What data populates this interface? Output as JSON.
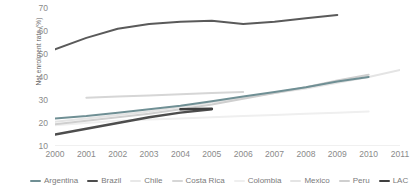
{
  "chart_data": {
    "type": "line",
    "title": "",
    "xlabel": "",
    "ylabel": "Net enrolment rate (%)",
    "xlim": [
      2000,
      2011
    ],
    "ylim": [
      10,
      70
    ],
    "yticks": [
      70,
      60,
      50,
      40,
      30,
      20,
      10
    ],
    "xticks": [
      2000,
      2001,
      2002,
      2003,
      2004,
      2005,
      2006,
      2007,
      2008,
      2009,
      2010,
      2011
    ],
    "grid": false,
    "legend_position": "bottom",
    "series": [
      {
        "name": "Argentina",
        "color": "#6f8f94",
        "width": 2.0,
        "x": [
          2000,
          2001,
          2002,
          2003,
          2004,
          2005,
          2006,
          2007,
          2008,
          2009,
          2010
        ],
        "values": [
          22,
          23,
          24.5,
          26,
          27.5,
          29.5,
          31.5,
          33.5,
          35.5,
          38,
          40
        ]
      },
      {
        "name": "Brazil",
        "color": "#4d4d4d",
        "width": 2.4,
        "x": [
          2000,
          2001,
          2002,
          2003,
          2004,
          2005
        ],
        "values": [
          15,
          17.5,
          20,
          22.5,
          24.5,
          26
        ]
      },
      {
        "name": "Chile",
        "color": "#5a5a5a",
        "width": 2.0,
        "x": [
          2000,
          2001,
          2002,
          2003,
          2004,
          2005,
          2006,
          2007,
          2008,
          2009
        ],
        "values": [
          52,
          57,
          61,
          63,
          64,
          64.5,
          63,
          64,
          65.5,
          67
        ]
      },
      {
        "name": "Costa Rica",
        "color": "#d6d6d6",
        "width": 2.0,
        "x": [
          2001,
          2002,
          2003,
          2004,
          2005,
          2006
        ],
        "values": [
          31,
          31.5,
          32,
          32.5,
          33,
          33.5
        ]
      },
      {
        "name": "Colombia",
        "color": "#efefef",
        "width": 2.0,
        "x": [
          2000,
          2001,
          2002,
          2003,
          2004,
          2005,
          2006,
          2007,
          2008,
          2009,
          2010
        ],
        "values": [
          19,
          20,
          21,
          21.5,
          22,
          22.5,
          23,
          23.5,
          24,
          24.5,
          25
        ]
      },
      {
        "name": "Mexico",
        "color": "#e4e4e4",
        "width": 2.0,
        "x": [
          2000,
          2001,
          2002,
          2003,
          2004,
          2005,
          2006,
          2007,
          2008,
          2009,
          2010,
          2011
        ],
        "values": [
          20.5,
          22,
          23.5,
          25,
          27,
          29,
          31,
          33,
          35,
          37.5,
          40,
          43
        ]
      },
      {
        "name": "Peru",
        "color": "#cfcfcf",
        "width": 2.0,
        "x": [
          2000,
          2001,
          2002,
          2003,
          2004,
          2005,
          2006,
          2007,
          2008,
          2009,
          2010
        ],
        "values": [
          19.5,
          21,
          22.5,
          24,
          26,
          28,
          30.5,
          33,
          35.5,
          38.5,
          41
        ]
      },
      {
        "name": "LAC",
        "color": "#3f3f3f",
        "width": 2.6,
        "x": [
          2004,
          2005
        ],
        "values": [
          26,
          26.2
        ]
      }
    ]
  },
  "legend": {
    "items": [
      {
        "label": "Argentina",
        "color": "#6f8f94"
      },
      {
        "label": "Brazil",
        "color": "#4d4d4d"
      },
      {
        "label": "Chile",
        "color": "#e8e8e8"
      },
      {
        "label": "Costa Rica",
        "color": "#d6d6d6"
      },
      {
        "label": "Colombia",
        "color": "#efefef"
      },
      {
        "label": "Mexico",
        "color": "#e4e4e4"
      },
      {
        "label": "Peru",
        "color": "#cfcfcf"
      },
      {
        "label": "LAC",
        "color": "#3f3f3f"
      }
    ]
  }
}
